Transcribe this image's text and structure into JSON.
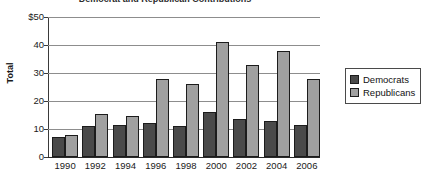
{
  "chart_data": {
    "type": "bar",
    "title": "Democrat and Republican Contributions",
    "xlabel": "",
    "ylabel": "Total",
    "ylim": [
      0,
      50
    ],
    "ytick_labels": [
      "$50",
      "40",
      "30",
      "20",
      "10",
      "0"
    ],
    "ytick_values": [
      50,
      40,
      30,
      20,
      10,
      0
    ],
    "grid": true,
    "legend_position": "right",
    "categories": [
      "1990",
      "1992",
      "1994",
      "1996",
      "1998",
      "2000",
      "2002",
      "2004",
      "2006"
    ],
    "series": [
      {
        "name": "Democrats",
        "color": "#4a4a4a",
        "values": [
          7,
          11,
          11.5,
          12,
          11,
          16,
          13.5,
          13,
          11.5
        ]
      },
      {
        "name": "Republicans",
        "color": "#a0a0a0",
        "values": [
          8,
          15.5,
          14.5,
          28,
          26,
          41,
          33,
          38,
          28
        ]
      }
    ]
  },
  "legend": {
    "entries": [
      {
        "label": "Democrats"
      },
      {
        "label": "Republicans"
      }
    ]
  }
}
